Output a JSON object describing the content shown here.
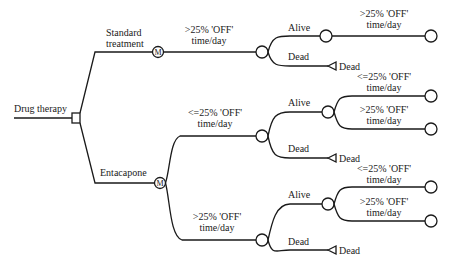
{
  "diagram": {
    "type": "decision-tree (Markov)",
    "root": {
      "label": "Drug therapy",
      "node": "decision-square"
    },
    "markov_symbol": "M",
    "arms": [
      {
        "label_line1": "Standard",
        "label_line2": "treatment",
        "node": "markov",
        "states": [
          {
            "label_line1": ">25% 'OFF'",
            "label_line2": "time/day",
            "node": "chance",
            "outcomes": [
              {
                "label": "Alive",
                "node": "chance",
                "next": [
                  {
                    "label_line1": ">25% 'OFF'",
                    "label_line2": "time/day",
                    "node": "terminal-circle"
                  }
                ]
              },
              {
                "label": "Dead",
                "node": "terminal-triangle",
                "terminal_label": "Dead"
              }
            ]
          }
        ]
      },
      {
        "label_line1": "Entacapone",
        "node": "markov",
        "states": [
          {
            "label_line1": "<=25% 'OFF'",
            "label_line2": "time/day",
            "node": "chance",
            "outcomes": [
              {
                "label": "Alive",
                "node": "chance",
                "next": [
                  {
                    "label_line1": "<=25% 'OFF'",
                    "label_line2": "time/day",
                    "node": "terminal-circle"
                  },
                  {
                    "label_line1": ">25% 'OFF'",
                    "label_line2": "time/day",
                    "node": "terminal-circle"
                  }
                ]
              },
              {
                "label": "Dead",
                "node": "terminal-triangle",
                "terminal_label": "Dead"
              }
            ]
          },
          {
            "label_line1": ">25% 'OFF'",
            "label_line2": "time/day",
            "node": "chance",
            "outcomes": [
              {
                "label": "Alive",
                "node": "chance",
                "next": [
                  {
                    "label_line1": "<=25% 'OFF'",
                    "label_line2": "time/day",
                    "node": "terminal-circle"
                  },
                  {
                    "label_line1": ">25% 'OFF'",
                    "label_line2": "time/day",
                    "node": "terminal-circle"
                  }
                ]
              },
              {
                "label": "Dead",
                "node": "terminal-triangle",
                "terminal_label": "Dead"
              }
            ]
          }
        ]
      }
    ]
  }
}
